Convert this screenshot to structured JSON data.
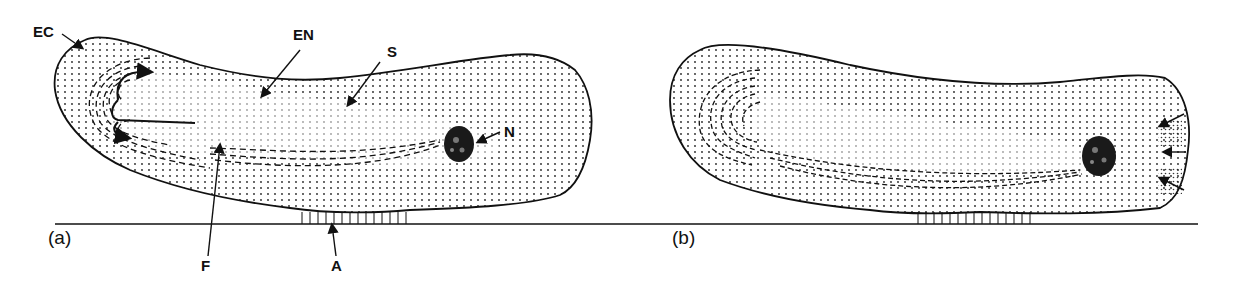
{
  "figure": {
    "panels": [
      {
        "id": "a",
        "label": "(a)"
      },
      {
        "id": "b",
        "label": "(b)"
      }
    ],
    "labels": {
      "ec": "EC",
      "en": "EN",
      "s": "S",
      "n": "N",
      "f": "F",
      "a": "A"
    },
    "colors": {
      "ink": "#111111",
      "background": "#ffffff"
    }
  }
}
